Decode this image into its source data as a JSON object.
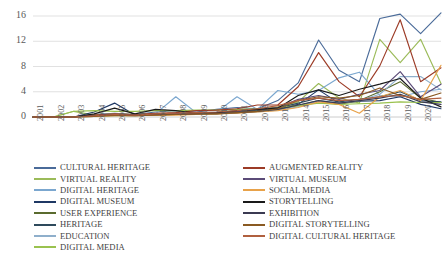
{
  "chart_data": {
    "type": "line",
    "title": "",
    "xlabel": "",
    "ylabel": "",
    "grid": true,
    "legend_position": "bottom",
    "ylim": [
      0,
      17
    ],
    "yticks": [
      0,
      4,
      8,
      12,
      16
    ],
    "categories": [
      "2001",
      "2002",
      "2003",
      "2004",
      "2005",
      "2006",
      "2007",
      "2008",
      "2009",
      "2010",
      "2011",
      "2012",
      "2013",
      "2014",
      "2015",
      "2016",
      "2017",
      "2018",
      "2019",
      "2020",
      "2021"
    ],
    "series": [
      {
        "name": "CULTURAL HERITAGE",
        "color": "#4a6b99",
        "values": [
          0,
          0,
          0,
          0.4,
          0.6,
          0.4,
          0.8,
          1.0,
          0.8,
          1.2,
          1.5,
          1.3,
          2.6,
          5.4,
          12.2,
          7.4,
          5.6,
          15.6,
          16.3,
          13.2,
          16.5
        ]
      },
      {
        "name": "VIRTUAL REALITY",
        "color": "#9bbb59",
        "values": [
          0,
          0,
          0.9,
          0.3,
          0.5,
          0.4,
          0.5,
          0.6,
          0.6,
          0.7,
          0.8,
          1.1,
          1.6,
          2.4,
          5.3,
          3.0,
          2.2,
          12.3,
          8.6,
          12.3,
          5.3
        ]
      },
      {
        "name": "DIGITAL HERITAGE",
        "color": "#7ba7cf",
        "values": [
          0,
          0,
          0,
          0.2,
          0.5,
          0.3,
          0.5,
          3.2,
          0.7,
          0.8,
          3.2,
          1.2,
          4.2,
          3.6,
          4.2,
          6.2,
          7.1,
          3.4,
          3.2,
          4.0,
          4.4
        ]
      },
      {
        "name": "DIGITAL MUSEUM",
        "color": "#1f3864",
        "values": [
          0,
          0,
          0,
          0.8,
          2.2,
          0.3,
          0.5,
          0.6,
          0.4,
          0.5,
          0.8,
          0.9,
          1.2,
          2.0,
          4.3,
          2.2,
          2.5,
          2.6,
          3.2,
          2.0,
          1.3
        ]
      },
      {
        "name": "USER EXPERIENCE",
        "color": "#5a6b2e",
        "values": [
          0,
          0,
          0,
          0.1,
          0.2,
          0.2,
          0.3,
          0.4,
          0.5,
          0.6,
          0.7,
          0.9,
          1.2,
          1.8,
          2.6,
          2.0,
          2.6,
          4.0,
          5.6,
          3.0,
          2.3
        ]
      },
      {
        "name": "HERITAGE",
        "color": "#2e4a5c",
        "values": [
          0,
          0,
          0,
          0.2,
          0.3,
          0.3,
          0.4,
          0.5,
          0.5,
          0.6,
          0.8,
          1.0,
          1.4,
          2.2,
          3.0,
          2.4,
          2.8,
          3.2,
          4.0,
          2.6,
          2.4
        ]
      },
      {
        "name": "EDUCATION",
        "color": "#8fafcb",
        "values": [
          0,
          0,
          0,
          0.1,
          0.3,
          0.2,
          0.4,
          0.4,
          0.5,
          0.6,
          0.7,
          0.8,
          1.1,
          1.6,
          2.6,
          2.2,
          2.6,
          3.6,
          6.4,
          6.4,
          4.3
        ]
      },
      {
        "name": "DIGITAL MEDIA",
        "color": "#9ac24f",
        "values": [
          0,
          0,
          0.9,
          1.0,
          0.9,
          0.9,
          1.0,
          1.0,
          1.1,
          1.1,
          1.2,
          1.3,
          1.5,
          1.8,
          2.2,
          2.0,
          2.1,
          2.2,
          2.4,
          2.3,
          2.3
        ]
      },
      {
        "name": "AUGMENTED REALITY",
        "color": "#9c3b26",
        "values": [
          0,
          0,
          0,
          0.3,
          0.5,
          0.4,
          0.6,
          0.7,
          1.0,
          1.1,
          1.3,
          1.9,
          1.9,
          4.8,
          10.2,
          5.6,
          3.2,
          8.1,
          15.4,
          5.6,
          7.8
        ]
      },
      {
        "name": "VIRTUAL MUSEUM",
        "color": "#5b4b78",
        "values": [
          0,
          0,
          0,
          0.2,
          0.4,
          0.3,
          0.4,
          0.5,
          0.6,
          0.7,
          0.9,
          1.2,
          1.5,
          2.8,
          3.4,
          2.8,
          3.6,
          4.2,
          7.2,
          3.2,
          5.2
        ]
      },
      {
        "name": "SOCIAL MEDIA",
        "color": "#e8a24a",
        "values": [
          0,
          0,
          0,
          0.1,
          0.2,
          0.2,
          0.3,
          0.3,
          0.4,
          0.5,
          0.6,
          0.8,
          1.0,
          1.5,
          2.4,
          2.0,
          0.6,
          3.2,
          4.2,
          2.6,
          8.2
        ]
      },
      {
        "name": "STORYTELLING",
        "color": "#1a1a1a",
        "values": [
          0,
          0,
          0,
          0.5,
          1.4,
          0.5,
          1.2,
          1.0,
          0.6,
          0.7,
          1.0,
          1.2,
          1.4,
          3.4,
          4.3,
          3.4,
          4.4,
          5.2,
          6.1,
          3.0,
          1.6
        ]
      },
      {
        "name": "EXHIBITION",
        "color": "#3b3a52",
        "values": [
          0,
          0,
          0,
          0.2,
          0.3,
          0.3,
          0.4,
          0.4,
          0.5,
          0.6,
          0.7,
          0.9,
          1.2,
          1.9,
          2.6,
          2.2,
          2.6,
          3.0,
          3.6,
          2.4,
          2.0
        ]
      },
      {
        "name": "DIGITAL STORYTELLING",
        "color": "#8a5a22",
        "values": [
          0,
          0,
          0,
          0.1,
          0.3,
          0.2,
          0.3,
          0.4,
          0.5,
          0.5,
          0.7,
          0.9,
          1.3,
          2.6,
          3.2,
          3.0,
          3.4,
          4.6,
          3.4,
          2.8,
          3.8
        ]
      },
      {
        "name": "DIGITAL CULTURAL HERITAGE",
        "color": "#b0603f",
        "values": [
          0,
          0,
          0,
          0.2,
          0.4,
          0.3,
          0.5,
          0.6,
          0.7,
          0.8,
          1.0,
          1.3,
          1.8,
          2.6,
          3.0,
          2.6,
          2.8,
          3.2,
          3.4,
          2.8,
          3.0
        ]
      }
    ]
  },
  "legend": {
    "left_column": [
      {
        "label": "CULTURAL HERITAGE",
        "color": "#4a6b99"
      },
      {
        "label": "VIRTUAL REALITY",
        "color": "#9bbb59"
      },
      {
        "label": "DIGITAL HERITAGE",
        "color": "#7ba7cf"
      },
      {
        "label": "DIGITAL MUSEUM",
        "color": "#1f3864"
      },
      {
        "label": "USER EXPERIENCE",
        "color": "#5a6b2e"
      },
      {
        "label": "HERITAGE",
        "color": "#2e4a5c"
      },
      {
        "label": "EDUCATION",
        "color": "#8fafcb"
      },
      {
        "label": "DIGITAL MEDIA",
        "color": "#9ac24f"
      }
    ],
    "right_column": [
      {
        "label": "AUGMENTED REALITY",
        "color": "#9c3b26"
      },
      {
        "label": "VIRTUAL MUSEUM",
        "color": "#5b4b78"
      },
      {
        "label": "SOCIAL MEDIA",
        "color": "#e8a24a"
      },
      {
        "label": "STORYTELLING",
        "color": "#1a1a1a"
      },
      {
        "label": "EXHIBITION",
        "color": "#3b3a52"
      },
      {
        "label": "DIGITAL STORYTELLING",
        "color": "#8a5a22"
      },
      {
        "label": "DIGITAL CULTURAL HERITAGE",
        "color": "#b0603f"
      }
    ]
  }
}
